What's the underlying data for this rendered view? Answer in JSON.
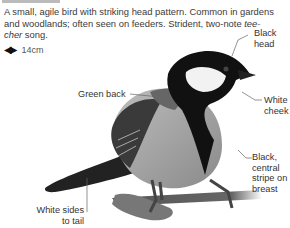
{
  "species_card": {
    "description_pre": "A small, agile bird with striking head pattern. Common in gardens and woodlands; often seen on feeders. Strident, two-note ",
    "description_song": "tee-cher",
    "description_post": " song.",
    "size_icon": "wingspan-arrows-icon",
    "size": "14cm"
  },
  "annotations": {
    "black_head": [
      "Black",
      "head"
    ],
    "green_back": "Green back",
    "white_cheek": [
      "White",
      "cheek"
    ],
    "breast_stripe": [
      "Black,",
      "central",
      "stripe on",
      "breast"
    ],
    "tail_sides": [
      "White sides",
      "to tail"
    ]
  }
}
